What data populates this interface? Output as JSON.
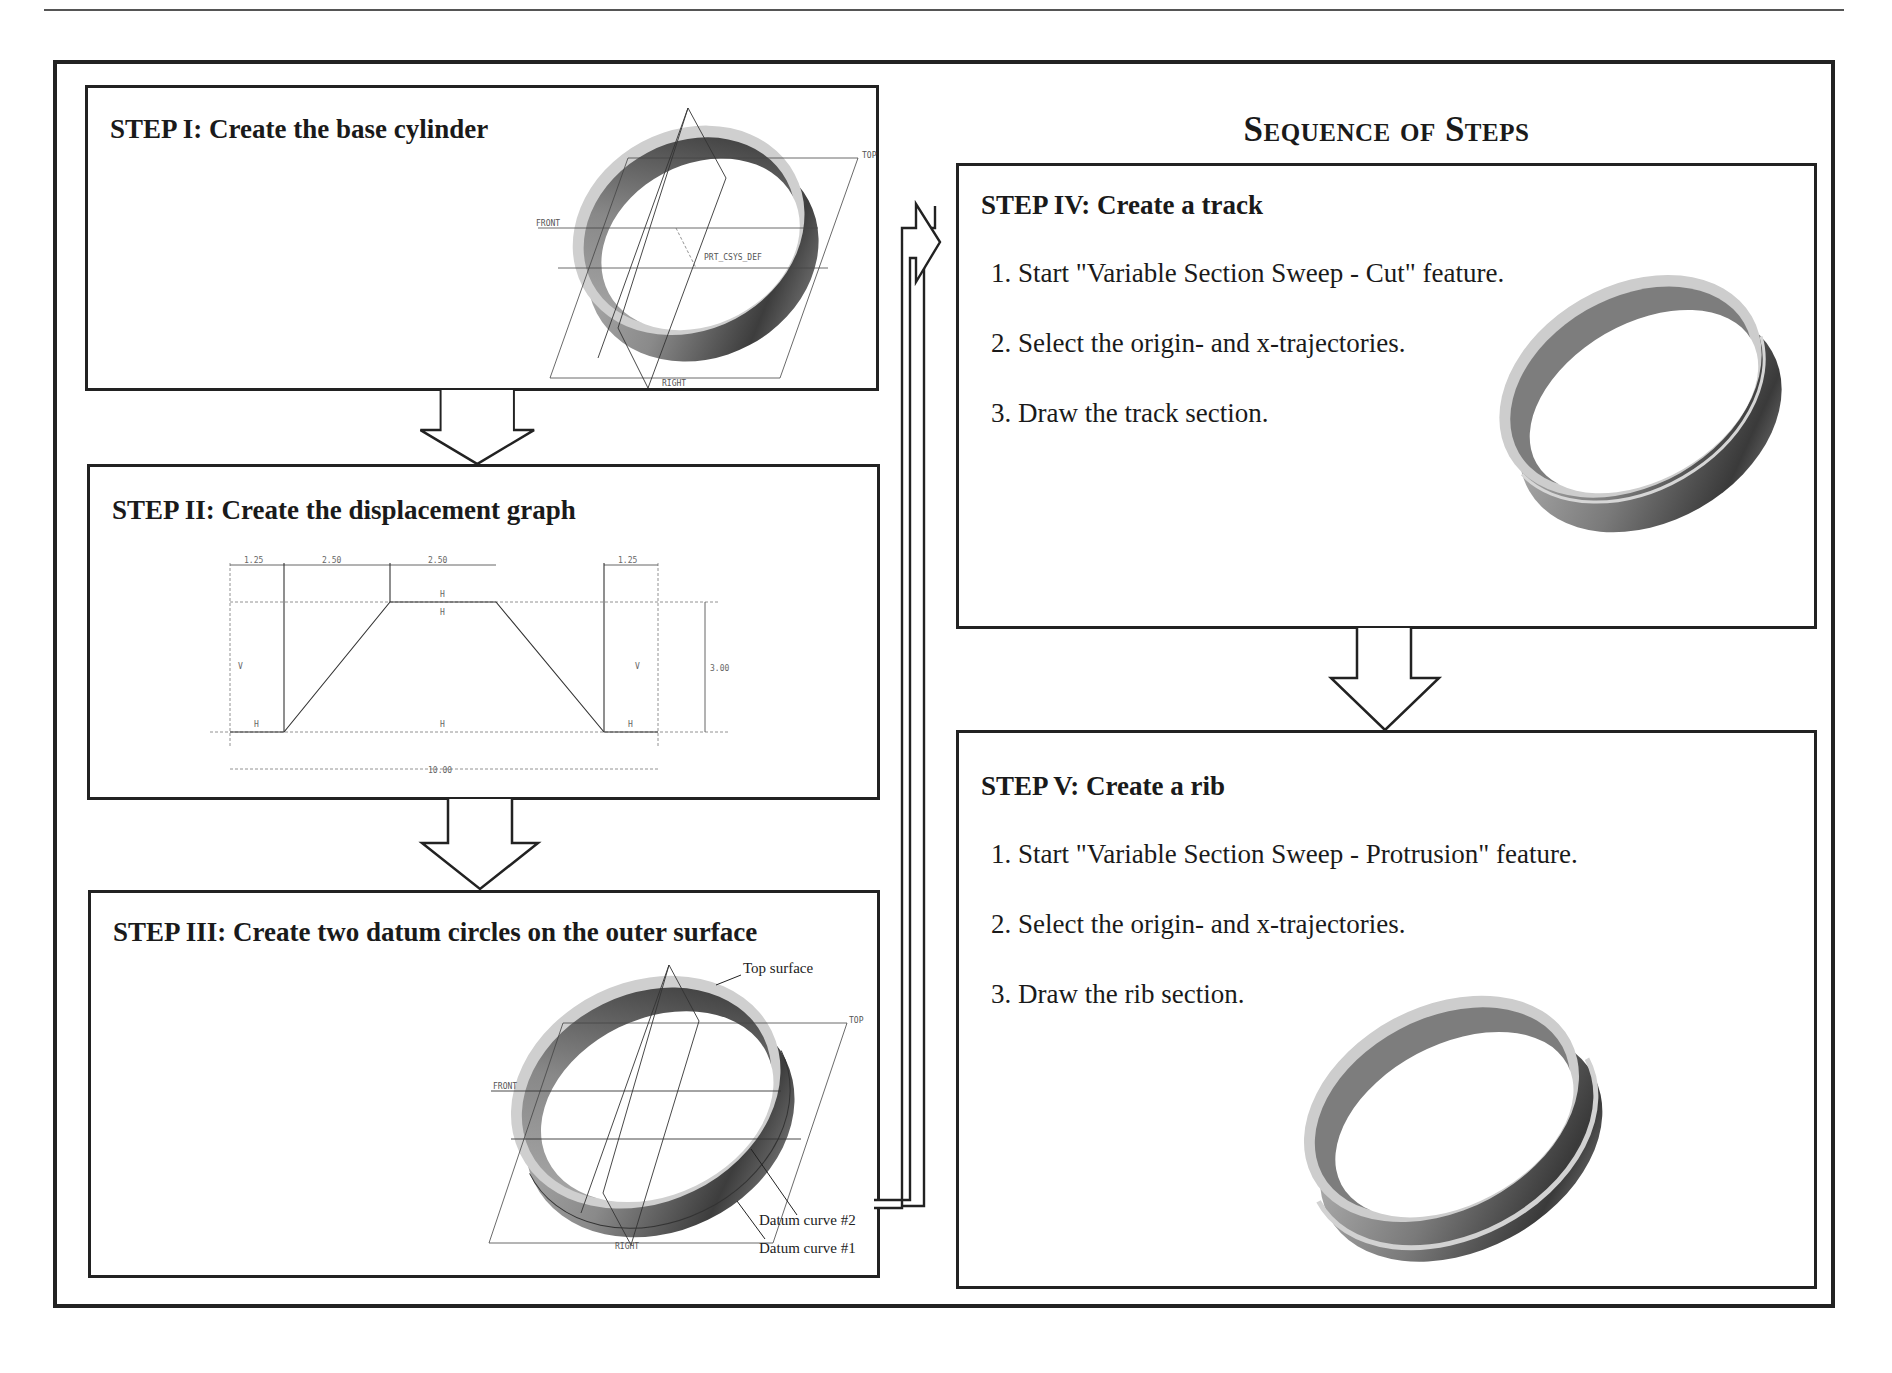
{
  "page": {
    "header_fragment": "Lesson 3   ·  ·  ·  ·",
    "title": "Sequence of Steps"
  },
  "steps": [
    {
      "id": "I",
      "title": "STEP I: Create the base cylinder",
      "items": [],
      "figure": {
        "type": "cad-ring-with-datums",
        "labels": [
          "TOP",
          "FRONT",
          "RIGHT",
          "PRT_CSYS_DEF"
        ]
      }
    },
    {
      "id": "II",
      "title": "STEP II: Create the displacement graph",
      "items": [],
      "figure": {
        "type": "displacement-graph",
        "dimensions": {
          "segments_top": [
            "1.25",
            "2.50",
            "2.50",
            "1.25"
          ],
          "height": "3.00",
          "total_length": "10.00"
        },
        "constraint_marks": [
          "V",
          "H",
          "H",
          "H",
          "H",
          "V",
          "H"
        ]
      }
    },
    {
      "id": "III",
      "title": "STEP III: Create two datum circles on the outer surface",
      "items": [],
      "figure": {
        "type": "cad-ring-with-datums",
        "labels": [
          "TOP",
          "FRONT",
          "RIGHT"
        ],
        "callouts": [
          "Top surface",
          "Datum curve #2",
          "Datum curve #1"
        ]
      }
    },
    {
      "id": "IV",
      "title": "STEP IV: Create a track",
      "items": [
        "1. Start \"Variable Section Sweep - Cut\" feature.",
        "2. Select the origin- and x-trajectories.",
        "3. Draw the track section."
      ],
      "figure": {
        "type": "ring-with-groove"
      }
    },
    {
      "id": "V",
      "title": "STEP V: Create a rib",
      "items": [
        "1. Start \"Variable Section Sweep - Protrusion\" feature.",
        "2. Select the origin- and x-trajectories.",
        "3. Draw the rib section."
      ],
      "figure": {
        "type": "ring-with-rib"
      }
    }
  ],
  "colors": {
    "border": "#222222",
    "ring_light": "#c8c8c8",
    "ring_mid": "#8f8f8f",
    "ring_dark": "#3a3a3a",
    "background": "#ffffff"
  }
}
